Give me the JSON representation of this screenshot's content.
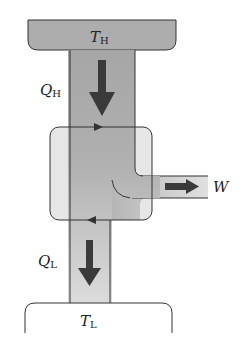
{
  "diagram": {
    "hot_reservoir": {
      "symbol": "T",
      "subscript": "H"
    },
    "cold_reservoir": {
      "symbol": "T",
      "subscript": "L"
    },
    "heat_in": {
      "symbol": "Q",
      "subscript": "H"
    },
    "heat_out": {
      "symbol": "Q",
      "subscript": "L"
    },
    "work": {
      "symbol": "W"
    }
  },
  "colors": {
    "hot_fill": "#a9a9a9",
    "channel_fill": "#b5b5b5",
    "cold_fill": "#d4d4d4",
    "arrow": "#3a3a3a",
    "outline": "#333333"
  }
}
